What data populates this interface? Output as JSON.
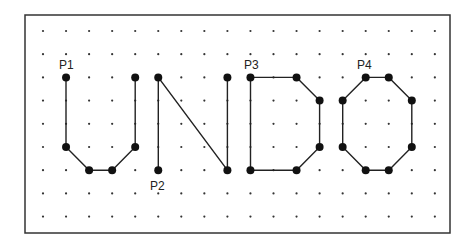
{
  "diagram": {
    "frame": {
      "x": 25,
      "y": 15,
      "width": 425,
      "height": 218,
      "stroke": "#333333"
    },
    "grid": {
      "origin_x": 43,
      "origin_y": 31,
      "spacing_x": 23.05,
      "spacing_y": 23.2,
      "cols": 18,
      "rows": 9,
      "dot_color": "#333333"
    },
    "stroke_color": "#222222",
    "node_color": "#111111",
    "letters": [
      {
        "name": "U",
        "closed": false,
        "points": [
          [
            1,
            2
          ],
          [
            1,
            5
          ],
          [
            2,
            6
          ],
          [
            3,
            6
          ],
          [
            4,
            5
          ],
          [
            4,
            2
          ]
        ]
      },
      {
        "name": "N",
        "closed": false,
        "points": [
          [
            5,
            6
          ],
          [
            5,
            2
          ],
          [
            8,
            6
          ],
          [
            8,
            2
          ]
        ]
      },
      {
        "name": "D",
        "closed": true,
        "points": [
          [
            9,
            2
          ],
          [
            11,
            2
          ],
          [
            12,
            3
          ],
          [
            12,
            5
          ],
          [
            11,
            6
          ],
          [
            9,
            6
          ]
        ]
      },
      {
        "name": "O",
        "closed": true,
        "points": [
          [
            14,
            2
          ],
          [
            15,
            2
          ],
          [
            16,
            3
          ],
          [
            16,
            5
          ],
          [
            15,
            6
          ],
          [
            14,
            6
          ],
          [
            13,
            5
          ],
          [
            13,
            3
          ]
        ]
      }
    ],
    "labels": [
      {
        "text": "P1",
        "x": 59,
        "y": 59
      },
      {
        "text": "P2",
        "x": 150,
        "y": 180
      },
      {
        "text": "P3",
        "x": 244,
        "y": 59
      },
      {
        "text": "P4",
        "x": 357,
        "y": 59
      }
    ]
  }
}
